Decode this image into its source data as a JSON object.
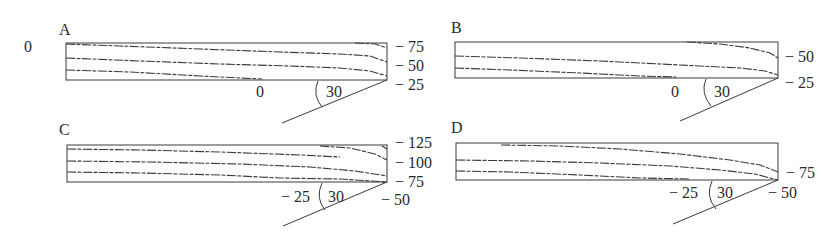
{
  "figure": {
    "stray_label": "0",
    "panels": [
      {
        "id": "A",
        "letter": "A",
        "right_labels": [
          "− 75",
          "− 50",
          "− 25"
        ],
        "bottom_left_label": "0",
        "angle_label": "30",
        "angle_deg": 30
      },
      {
        "id": "B",
        "letter": "B",
        "right_labels": [
          "− 50",
          "− 25"
        ],
        "bottom_left_label": "0",
        "angle_label": "30",
        "angle_deg": 30
      },
      {
        "id": "C",
        "letter": "C",
        "right_labels": [
          "− 125",
          "− 100",
          "− 75"
        ],
        "bottom_right_label": "− 50",
        "bottom_left_label": "− 25",
        "angle_label": "30",
        "angle_deg": 30
      },
      {
        "id": "D",
        "letter": "D",
        "right_labels": [
          "− 75"
        ],
        "bottom_right_label": "− 50",
        "bottom_left_label": "− 25",
        "angle_label": "30",
        "angle_deg": 30
      }
    ]
  },
  "colors": {
    "line": "#3a3a3a",
    "text": "#2a2a2a",
    "background": "#ffffff"
  }
}
